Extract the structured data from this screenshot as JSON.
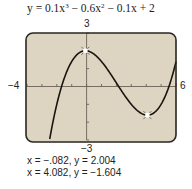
{
  "chart_data": {
    "type": "line",
    "function": {
      "coefficients": [
        0.1,
        -0.6,
        -0.1,
        2
      ]
    },
    "xlim": [
      -4,
      6
    ],
    "ylim": [
      -3,
      3
    ],
    "xticks": [
      -4,
      -3,
      -2,
      -1,
      0,
      1,
      2,
      3,
      4,
      5,
      6
    ],
    "yticks": [
      -3,
      -2,
      -1,
      0,
      1,
      2,
      3
    ],
    "axis_labels": {
      "xmin": "−4",
      "xmax": "6",
      "ymax": "3",
      "ymin": "−3"
    },
    "grid": false,
    "series": [
      {
        "name": "y = 0.1x^3 - 0.6x^2 - 0.1x + 2",
        "x": [
          -2.2,
          -2,
          -1.5,
          -1,
          -0.5,
          -0.082,
          0.5,
          1,
          1.5,
          2,
          2.5,
          3,
          3.5,
          4.082,
          4.5,
          5,
          5.5,
          6
        ],
        "y": [
          -1.81,
          -0.6,
          0.46,
          1.5,
          1.89,
          2.004,
          1.86,
          1.4,
          0.84,
          0.2,
          -0.31,
          -0.8,
          -1.26,
          -1.604,
          -1.5,
          -0.5,
          0.7,
          2.0
        ]
      }
    ],
    "annotations": [
      {
        "type": "marker",
        "label": "relative maximum",
        "x": -0.082,
        "y": 2.004
      },
      {
        "type": "marker",
        "label": "relative minimum",
        "x": 4.082,
        "y": -1.604
      }
    ],
    "xlabel": "",
    "ylabel": ""
  },
  "equation": {
    "prefix": "y = 0.1x",
    "exp1": "3",
    "mid": " − 0.6x",
    "exp2": "2",
    "suffix": " − 0.1x + 2"
  },
  "results": [
    "x = −.082, y = 2.004",
    "x = 4.082, y = −1.604"
  ],
  "colors": {
    "screen_bg": "#ddd5c2",
    "screen_border": "#2a2520",
    "curve": "#1a1410",
    "axis": "#6b6256",
    "marker": "#ffffff"
  }
}
